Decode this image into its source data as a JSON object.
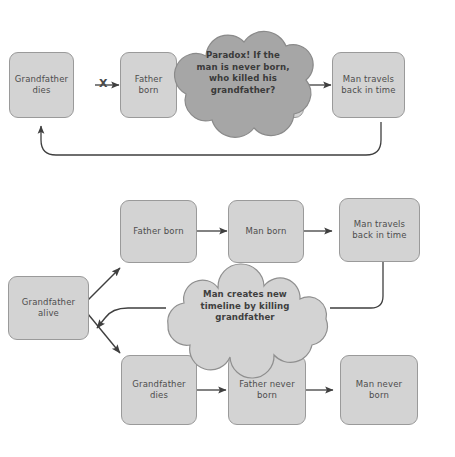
{
  "diagram": {
    "colors": {
      "box_fill": "#d3d3d3",
      "box_border": "#9a9a9a",
      "cloud_dark_fill": "#a6a6a6",
      "cloud_light_fill": "#d3d3d3",
      "cloud_border": "#8f8f8f",
      "arrow": "#3f3f3f",
      "text": "#4d4d4d",
      "background": "#ffffff"
    },
    "panels": [
      {
        "id": "paradox-panel",
        "name": "Grandfather paradox loop",
        "nodes": [
          {
            "id": "gf-dies",
            "label": "Grandfather\ndies",
            "line1": "Grandfather",
            "line2": "dies"
          },
          {
            "id": "father-born",
            "label": "Father\nborn",
            "line1": "Father",
            "line2": "born"
          },
          {
            "id": "man-born-hidden",
            "label": "Man born",
            "line1": "Man born",
            "line2": ""
          },
          {
            "id": "man-travels",
            "label": "Man travels\nback in time",
            "line1": "Man travels",
            "line2": "back in time"
          }
        ],
        "cloud": {
          "id": "paradox-cloud",
          "lines": [
            "Paradox! If the",
            "man is never born,",
            "who killed his",
            "grandfather?"
          ]
        },
        "cross_marker": "X"
      },
      {
        "id": "timeline-panel",
        "name": "New timeline branch",
        "nodes": [
          {
            "id": "gf-alive",
            "label": "Grandfather\nalive",
            "line1": "Grandfather",
            "line2": "alive"
          },
          {
            "id": "father-born-2",
            "label": "Father born",
            "line1": "Father born",
            "line2": ""
          },
          {
            "id": "man-born-2",
            "label": "Man born",
            "line1": "Man born",
            "line2": ""
          },
          {
            "id": "man-travels-2",
            "label": "Man travels\nback in time",
            "line1": "Man travels",
            "line2": "back in time"
          },
          {
            "id": "gf-dies-2",
            "label": "Grandfather\ndies",
            "line1": "Grandfather",
            "line2": "dies"
          },
          {
            "id": "father-never-born",
            "label": "Father never\nborn",
            "line1": "Father never",
            "line2": "born"
          },
          {
            "id": "man-never-born",
            "label": "Man never\nborn",
            "line1": "Man never",
            "line2": "born"
          }
        ],
        "cloud": {
          "id": "timeline-cloud",
          "lines": [
            "Man creates new",
            "timeline by killing",
            "grandfather"
          ]
        }
      }
    ]
  }
}
